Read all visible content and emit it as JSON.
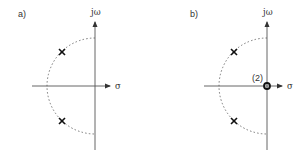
{
  "panels": [
    {
      "id": "a",
      "label": "a)",
      "y_axis_label": "jω",
      "x_axis_label": "σ",
      "poles": [
        {
          "marker": "cross",
          "position": "upper-left"
        },
        {
          "marker": "cross",
          "position": "lower-left"
        }
      ],
      "zeros": []
    },
    {
      "id": "b",
      "label": "b)",
      "y_axis_label": "jω",
      "x_axis_label": "σ",
      "poles": [
        {
          "marker": "cross",
          "position": "upper-left"
        },
        {
          "marker": "cross",
          "position": "lower-left"
        }
      ],
      "zeros": [
        {
          "marker": "circle",
          "position": "origin",
          "multiplicity_label": "(2)"
        }
      ]
    }
  ],
  "colors": {
    "axis": "#555555",
    "marker": "#111111",
    "arc": "#777777"
  }
}
